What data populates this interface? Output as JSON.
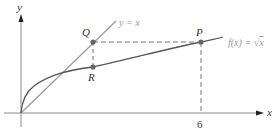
{
  "diagram": {
    "axes": {
      "x_label": "x",
      "y_label": "y",
      "x_tick_label": "6"
    },
    "curves": {
      "line_label": "y = x",
      "sqrt_label_prefix": "f(x) = ",
      "sqrt_label_radical": "√",
      "sqrt_label_arg": "x"
    },
    "points": {
      "Q": "Q",
      "R": "R",
      "P": "P"
    },
    "colors": {
      "axis": "#8a8a8a",
      "line": "#9a9a9a",
      "curve": "#555555",
      "point": "#666666",
      "dashed": "#777777",
      "label_gray": "#9a9a9a"
    }
  }
}
